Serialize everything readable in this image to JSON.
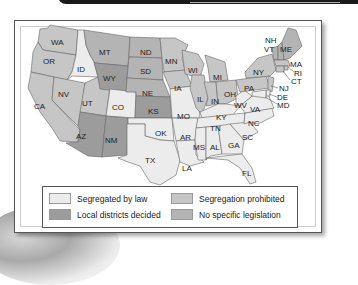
{
  "colors": {
    "segregated": "#ececec",
    "local": "#9c9c9c",
    "prohibited": "#c6c6c6",
    "none": "#b4b4b4"
  },
  "legend": {
    "items": [
      {
        "label": "Segregated by law",
        "category": "segregated"
      },
      {
        "label": "Local districts decided",
        "category": "local"
      },
      {
        "label": "Segregation prohibited",
        "category": "prohibited"
      },
      {
        "label": "No specific legislation",
        "category": "none"
      }
    ]
  },
  "states": {
    "WA": "prohibited",
    "OR": "prohibited",
    "CA": "prohibited",
    "ID": "segregated",
    "NV": "prohibited",
    "UT": "prohibited",
    "AZ": "local",
    "MT": "none",
    "WY": "local",
    "CO": "segregated",
    "NM": "local",
    "ND": "none",
    "SD": "none",
    "NE": "none",
    "KS": "local",
    "OK": "segregated",
    "TX": "segregated",
    "MN": "prohibited",
    "IA": "prohibited",
    "MO": "segregated",
    "AR": "segregated",
    "LA": "segregated",
    "WI": "prohibited",
    "IL": "prohibited",
    "MI": "prohibited",
    "IN": "prohibited",
    "OH": "prohibited",
    "KY": "segregated",
    "TN": "segregated",
    "MS": "segregated",
    "AL": "segregated",
    "GA": "segregated",
    "FL": "segregated",
    "SC": "segregated",
    "NC": "segregated",
    "VA": "segregated",
    "WV": "segregated",
    "PA": "prohibited",
    "NY": "prohibited",
    "VT": "none",
    "NH": "none",
    "ME": "none",
    "MA": "prohibited",
    "RI": "prohibited",
    "CT": "prohibited",
    "NJ": "prohibited",
    "DE": "segregated",
    "MD": "segregated"
  },
  "labels": {
    "WA": "WA",
    "OR": "OR",
    "CA": "CA",
    "ID": "ID",
    "NV": "NV",
    "UT": "UT",
    "AZ": "AZ",
    "MT": "MT",
    "WY": "WY",
    "CO": "CO",
    "NM": "NM",
    "ND": "ND",
    "SD": "SD",
    "NE": "NE",
    "KS": "KS",
    "OK": "OK",
    "TX": "TX",
    "MN": "MN",
    "IA": "IA",
    "MO": "MO",
    "AR": "AR",
    "LA": "LA",
    "WI": "WI",
    "IL": "IL",
    "MI": "MI",
    "IN": "IN",
    "OH": "OH",
    "KY": "KY",
    "TN": "TN",
    "MS": "MS",
    "AL": "AL",
    "GA": "GA",
    "FL": "FL",
    "SC": "SC",
    "NC": "NC",
    "VA": "VA",
    "WV": "WV",
    "PA": "PA",
    "NY": "NY",
    "VT": "VT",
    "NH": "NH",
    "ME": "ME",
    "MA": "MA",
    "RI": "RI",
    "CT": "CT",
    "NJ": "NJ",
    "DE": "DE",
    "MD": "MD"
  }
}
